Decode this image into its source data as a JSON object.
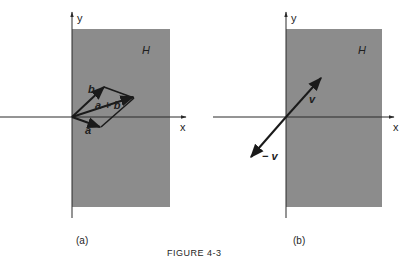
{
  "figure": {
    "caption": "FIGURE 4-3",
    "colors": {
      "region_fill": "#8c8c8c",
      "axis": "#2a2a2a",
      "vector": "#1a1a1a",
      "background": "#ffffff"
    },
    "panels": [
      {
        "id": "a",
        "label": "(a)",
        "region_label": "H",
        "x_axis_label": "x",
        "y_axis_label": "y",
        "vectors": [
          {
            "name": "a",
            "label": "a"
          },
          {
            "name": "b",
            "label": "b"
          },
          {
            "name": "a_plus_b",
            "label": "a + b"
          }
        ]
      },
      {
        "id": "b",
        "label": "(b)",
        "region_label": "H",
        "x_axis_label": "x",
        "y_axis_label": "y",
        "vectors": [
          {
            "name": "v",
            "label": "v"
          },
          {
            "name": "neg_v",
            "label": "− v"
          }
        ]
      }
    ]
  }
}
